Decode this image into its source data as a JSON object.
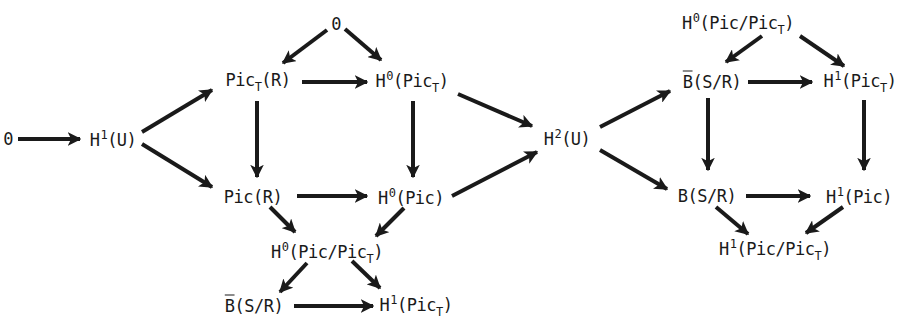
{
  "diagram": {
    "title": "",
    "nodes": [
      {
        "id": "zero_left",
        "x": 8,
        "y": 139,
        "base": "0",
        "sup": "",
        "pre": "",
        "sub": "",
        "post": ""
      },
      {
        "id": "h1_u",
        "x": 113,
        "y": 139,
        "base": "H",
        "sup": "1",
        "pre": "",
        "sub": "",
        "post": "(U)"
      },
      {
        "id": "zero_top",
        "x": 336,
        "y": 24,
        "base": "0",
        "sup": "",
        "pre": "",
        "sub": "",
        "post": ""
      },
      {
        "id": "pict_r",
        "x": 258,
        "y": 82,
        "base": "Pic",
        "sup": "",
        "pre": "",
        "sub": "T",
        "post": "(R)"
      },
      {
        "id": "h0_pict",
        "x": 412,
        "y": 82,
        "base": "H",
        "sup": "0",
        "pre": "",
        "sub": "",
        "post": "(Pic",
        "post_sub": "T",
        "post_end": ")"
      },
      {
        "id": "pic_r",
        "x": 253,
        "y": 197,
        "base": "Pic(R)",
        "sup": "",
        "pre": "",
        "sub": "",
        "post": ""
      },
      {
        "id": "h0_pic",
        "x": 411,
        "y": 197,
        "base": "H",
        "sup": "0",
        "pre": "",
        "sub": "",
        "post": "(Pic)"
      },
      {
        "id": "h2_u",
        "x": 567,
        "y": 138,
        "base": "H",
        "sup": "2",
        "pre": "",
        "sub": "",
        "post": "(U)"
      },
      {
        "id": "h0_picquot_mid",
        "x": 327,
        "y": 253,
        "base": "H",
        "sup": "0",
        "pre": "",
        "sub": "",
        "post": "(Pic/Pic",
        "post_sub": "T",
        "post_end": ")"
      },
      {
        "id": "bbar_sr_bot",
        "x": 254,
        "y": 306,
        "base": "B",
        "bar": true,
        "post": "(S/R)"
      },
      {
        "id": "h1_pict_bot",
        "x": 416,
        "y": 306,
        "base": "H",
        "sup": "1",
        "post": "(Pic",
        "post_sub": "T",
        "post_end": ")"
      },
      {
        "id": "h0_picquot_top",
        "x": 738,
        "y": 24,
        "base": "H",
        "sup": "0",
        "post": "(Pic/Pic",
        "post_sub": "T",
        "post_end": ")"
      },
      {
        "id": "bbar_sr_top",
        "x": 712,
        "y": 82,
        "base": "B",
        "bar": true,
        "post": "(S/R)"
      },
      {
        "id": "h1_pict_top",
        "x": 860,
        "y": 82,
        "base": "H",
        "sup": "1",
        "post": "(Pic",
        "post_sub": "T",
        "post_end": ")"
      },
      {
        "id": "b_sr",
        "x": 707,
        "y": 196,
        "base": "B",
        "post": "(S/R)"
      },
      {
        "id": "h1_pic",
        "x": 859,
        "y": 196,
        "base": "H",
        "sup": "1",
        "post": "(Pic)"
      },
      {
        "id": "h1_picquot",
        "x": 775,
        "y": 250,
        "base": "H",
        "sup": "1",
        "post": "(Pic/Pic",
        "post_sub": "T",
        "post_end": ")"
      }
    ],
    "arrows": [
      {
        "from": "zero_left",
        "to": "h1_u",
        "x1": 18,
        "y1": 139,
        "x2": 80,
        "y2": 139
      },
      {
        "from": "h1_u",
        "to": "pict_r",
        "x1": 142,
        "y1": 132,
        "x2": 212,
        "y2": 90
      },
      {
        "from": "h1_u",
        "to": "pic_r",
        "x1": 142,
        "y1": 144,
        "x2": 212,
        "y2": 187
      },
      {
        "from": "zero_top",
        "to": "pict_r",
        "x1": 327,
        "y1": 30,
        "x2": 283,
        "y2": 63
      },
      {
        "from": "zero_top",
        "to": "h0_pict",
        "x1": 345,
        "y1": 29,
        "x2": 381,
        "y2": 60
      },
      {
        "from": "pict_r",
        "to": "h0_pict",
        "x1": 302,
        "y1": 82,
        "x2": 367,
        "y2": 82
      },
      {
        "from": "pict_r",
        "to": "pic_r",
        "x1": 257,
        "y1": 101,
        "x2": 257,
        "y2": 177
      },
      {
        "from": "h0_pict",
        "to": "h0_pic",
        "x1": 413,
        "y1": 101,
        "x2": 413,
        "y2": 177
      },
      {
        "from": "h0_pict",
        "to": "h2_u",
        "x1": 458,
        "y1": 94,
        "x2": 532,
        "y2": 126
      },
      {
        "from": "pic_r",
        "to": "h0_pic",
        "x1": 297,
        "y1": 196,
        "x2": 367,
        "y2": 196
      },
      {
        "from": "h0_pic",
        "to": "h2_u",
        "x1": 452,
        "y1": 196,
        "x2": 537,
        "y2": 152
      },
      {
        "from": "h2_u",
        "to": "bbar_sr_top",
        "x1": 600,
        "y1": 127,
        "x2": 670,
        "y2": 91
      },
      {
        "from": "h2_u",
        "to": "b_sr",
        "x1": 600,
        "y1": 150,
        "x2": 667,
        "y2": 189
      },
      {
        "from": "pic_r",
        "to": "h0_picquot_mid",
        "x1": 270,
        "y1": 207,
        "x2": 295,
        "y2": 232
      },
      {
        "from": "h0_pic",
        "to": "h0_picquot_mid",
        "x1": 404,
        "y1": 208,
        "x2": 376,
        "y2": 236
      },
      {
        "from": "h0_picquot_mid",
        "to": "bbar_sr_bot",
        "x1": 307,
        "y1": 263,
        "x2": 280,
        "y2": 292
      },
      {
        "from": "h0_picquot_mid",
        "to": "h1_pict_bot",
        "x1": 352,
        "y1": 261,
        "x2": 380,
        "y2": 288
      },
      {
        "from": "bbar_sr_bot",
        "to": "h1_pict_bot",
        "x1": 294,
        "y1": 306,
        "x2": 373,
        "y2": 306
      },
      {
        "from": "h0_picquot_top",
        "to": "bbar_sr_top",
        "x1": 762,
        "y1": 36,
        "x2": 726,
        "y2": 62
      },
      {
        "from": "h0_picquot_top",
        "to": "h1_pict_top",
        "x1": 800,
        "y1": 36,
        "x2": 844,
        "y2": 66
      },
      {
        "from": "bbar_sr_top",
        "to": "h1_pict_top",
        "x1": 748,
        "y1": 82,
        "x2": 812,
        "y2": 82
      },
      {
        "from": "bbar_sr_top",
        "to": "b_sr",
        "x1": 708,
        "y1": 98,
        "x2": 708,
        "y2": 170
      },
      {
        "from": "h1_pict_top",
        "to": "h1_pic",
        "x1": 864,
        "y1": 100,
        "x2": 864,
        "y2": 170
      },
      {
        "from": "b_sr",
        "to": "h1_pic",
        "x1": 746,
        "y1": 196,
        "x2": 810,
        "y2": 196
      },
      {
        "from": "b_sr",
        "to": "h1_picquot",
        "x1": 716,
        "y1": 207,
        "x2": 748,
        "y2": 234
      },
      {
        "from": "h1_pic",
        "to": "h1_picquot",
        "x1": 843,
        "y1": 207,
        "x2": 806,
        "y2": 233
      }
    ],
    "colors": {
      "ink": "#1a1a1a",
      "background": "#ffffff"
    }
  }
}
